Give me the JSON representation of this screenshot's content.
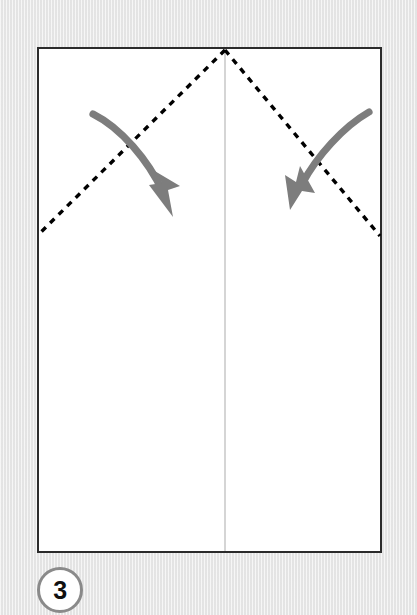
{
  "diagram": {
    "kind": "origami-fold-instruction",
    "step_number": "3",
    "canvas": {
      "width": 417,
      "height": 615
    },
    "colors": {
      "background": "#ebebeb",
      "paper_fill": "#ffffff",
      "paper_border": "#2b2b2b",
      "crease_line": "#000000",
      "center_line": "#b9b9b9",
      "arrow": "#7d7d7d",
      "badge_ring": "#8a8a8a",
      "badge_fill": "#ffffff",
      "badge_text": "#111111"
    },
    "paper": {
      "label": "paper-sheet",
      "x": 38,
      "y": 48,
      "width": 343,
      "height": 504,
      "border_width": 2
    },
    "center_line": {
      "label": "vertical-center-crease",
      "x": 225,
      "y1": 50,
      "y2": 551,
      "width": 1
    },
    "crease_lines": [
      {
        "label": "left-diagonal-crease",
        "style": "dashed",
        "x1": 225,
        "y1": 50,
        "x2": 39,
        "y2": 234,
        "dash": "6 6",
        "width": 3.4
      },
      {
        "label": "right-diagonal-crease",
        "style": "dashed",
        "x1": 225,
        "y1": 50,
        "x2": 380,
        "y2": 236,
        "dash": "6 6",
        "width": 3.4
      }
    ],
    "arrows": [
      {
        "label": "left-fold-arrow",
        "direction": "down-right",
        "start": {
          "x": 93,
          "y": 114
        },
        "end": {
          "x": 168,
          "y": 207
        },
        "control": {
          "x": 128,
          "y": 138
        },
        "width": 7
      },
      {
        "label": "right-fold-arrow",
        "direction": "down-left",
        "start": {
          "x": 369,
          "y": 112
        },
        "end": {
          "x": 296,
          "y": 198
        },
        "control": {
          "x": 333,
          "y": 136
        },
        "width": 7
      }
    ],
    "badge": {
      "label": "step-number-badge",
      "cx": 60,
      "cy": 590,
      "radius": 23
    }
  }
}
